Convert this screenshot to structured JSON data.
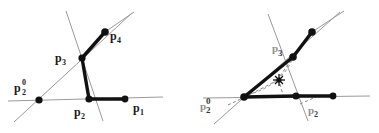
{
  "figure": {
    "name": "two-panel-geometry-figure",
    "background": "#ffffff",
    "width": 379,
    "height": 133,
    "colors": {
      "thick_stroke": "#111111",
      "thin_stroke": "#9a9a9a",
      "dashed_stroke": "#8a8a8a",
      "label_dark": "#1a1a1a",
      "label_faded": "#8f8f8f",
      "node_fill": "#111111"
    }
  },
  "left_panel": {
    "name": "polyline-configuration",
    "labels": [
      {
        "id": "p1",
        "base": "p",
        "sub": "1",
        "sup": "",
        "x": 133,
        "y": 112,
        "shade": "dark"
      },
      {
        "id": "p2",
        "base": "p",
        "sub": "2",
        "sup": "",
        "x": 74,
        "y": 116,
        "shade": "dark"
      },
      {
        "id": "p20",
        "base": "p",
        "sub": "2",
        "sup": "0",
        "x": 14,
        "y": 92,
        "shade": "dark"
      },
      {
        "id": "p3",
        "base": "p",
        "sub": "3",
        "sup": "",
        "x": 55,
        "y": 62,
        "shade": "dark"
      },
      {
        "id": "p4",
        "base": "p",
        "sub": "4",
        "sup": "",
        "x": 110,
        "y": 40,
        "shade": "dark"
      }
    ],
    "nodes": [
      {
        "id": "p1",
        "x": 125,
        "y": 99
      },
      {
        "id": "p2",
        "x": 89,
        "y": 99
      },
      {
        "id": "p20",
        "x": 39,
        "y": 100
      },
      {
        "id": "p3",
        "x": 82,
        "y": 58
      },
      {
        "id": "p4",
        "x": 105,
        "y": 32
      }
    ],
    "thick_path": "M125,99 L89,99 L82,58 L105,32",
    "thin_lines": [
      {
        "name": "horizontal-baseline",
        "x1": 8,
        "y1": 101,
        "x2": 163,
        "y2": 97
      },
      {
        "name": "diagonal-through-p20-p3",
        "x1": 14,
        "y1": 122,
        "x2": 132,
        "y2": 13
      },
      {
        "name": "steep-line-through-p3",
        "x1": 103,
        "y1": 121,
        "x2": 66,
        "y2": 11
      },
      {
        "name": "upper-right-ray",
        "x1": 105,
        "y1": 32,
        "x2": 134,
        "y2": 12
      }
    ]
  },
  "right_panel": {
    "name": "triangle-incenter-configuration",
    "labels": [
      {
        "id": "p2prime",
        "base": "p",
        "sub": "2",
        "sup": "",
        "x": 308,
        "y": 114,
        "shade": "faded"
      },
      {
        "id": "p20prime",
        "base": "p",
        "sub": "2",
        "sup": "0",
        "x": 200,
        "y": 110,
        "shade": "faded"
      },
      {
        "id": "p3prime",
        "base": "p",
        "sub": "3",
        "sup": "",
        "x": 272,
        "y": 52,
        "shade": "faded"
      }
    ],
    "nodes": [
      {
        "id": "left-vertex",
        "x": 244,
        "y": 97
      },
      {
        "id": "p2prime",
        "x": 296,
        "y": 96
      },
      {
        "id": "right-end",
        "x": 333,
        "y": 96
      },
      {
        "id": "p3prime",
        "x": 293,
        "y": 57
      },
      {
        "id": "upper-right",
        "x": 312,
        "y": 32
      }
    ],
    "thick_paths": [
      "M244,97 L293,57 L312,32",
      "M244,97 L296,96 L333,96"
    ],
    "thin_lines": [
      {
        "name": "horizontal-baseline",
        "x1": 203,
        "y1": 98,
        "x2": 370,
        "y2": 96
      },
      {
        "name": "steep-line-through-p3",
        "x1": 308,
        "y1": 121,
        "x2": 268,
        "y2": 14
      },
      {
        "name": "diagonal-through-left-vertex",
        "x1": 214,
        "y1": 124,
        "x2": 340,
        "y2": 12
      },
      {
        "name": "upper-right-ray",
        "x1": 312,
        "y1": 32,
        "x2": 344,
        "y2": 11
      }
    ],
    "dashed_lines": [
      {
        "name": "spoke-to-left-vertex",
        "x1": 278,
        "y1": 80,
        "x2": 246,
        "y2": 96
      },
      {
        "name": "spoke-to-p3prime",
        "x1": 280,
        "y1": 76,
        "x2": 292,
        "y2": 59
      },
      {
        "name": "spoke-to-baseline",
        "x1": 280,
        "y1": 83,
        "x2": 283,
        "y2": 95
      },
      {
        "name": "arc-left-lower",
        "x1": 228,
        "y1": 104,
        "x2": 246,
        "y2": 96
      },
      {
        "name": "arc-right-lower",
        "x1": 300,
        "y1": 103,
        "x2": 315,
        "y2": 97
      }
    ],
    "dashed_arc": "M248,95 Q280,84 292,60",
    "star_marker": {
      "name": "incenter-star",
      "x": 279,
      "y": 80,
      "rays": 8,
      "radius": 6
    }
  }
}
